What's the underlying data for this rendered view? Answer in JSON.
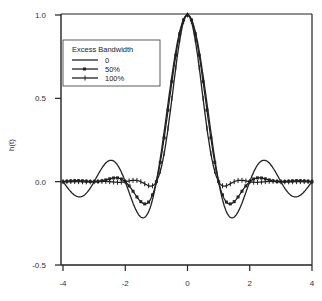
{
  "chart_data": {
    "type": "line",
    "title": "",
    "xlabel": "",
    "ylabel": "h(t)",
    "xlim": [
      -4,
      4
    ],
    "ylim": [
      -0.5,
      1.0
    ],
    "xticks": [
      "-4",
      "-2",
      "0",
      "2",
      "4"
    ],
    "yticks": [
      "1.0",
      "0.5",
      "0.0",
      "-0.5"
    ],
    "grid": false,
    "legend": {
      "title": "Excess Bandwidth",
      "position": "upper-left",
      "entries": [
        "0",
        "50%",
        "100%"
      ]
    },
    "series": [
      {
        "name": "0",
        "alpha": 0.0,
        "marker": "none",
        "x": [
          -4,
          -3.5,
          -3,
          -2.5,
          -2,
          -1.5,
          -1,
          -0.5,
          0,
          0.5,
          1,
          1.5,
          2,
          2.5,
          3,
          3.5,
          4
        ],
        "values": [
          0,
          -0.09,
          0,
          0.127,
          0,
          -0.212,
          0,
          0.637,
          1.0,
          0.637,
          0,
          -0.212,
          0,
          0.127,
          0,
          -0.09,
          0
        ]
      },
      {
        "name": "50%",
        "alpha": 0.5,
        "marker": "square",
        "x": [
          -4,
          -3.5,
          -3,
          -2.5,
          -2,
          -1.5,
          -1,
          -0.5,
          0,
          0.5,
          1,
          1.5,
          2,
          2.5,
          3,
          3.5,
          4
        ],
        "values": [
          0,
          0.0,
          0,
          0.02,
          0,
          -0.127,
          0,
          0.6,
          1.0,
          0.6,
          0,
          -0.127,
          0,
          0.02,
          0,
          0.0,
          0
        ]
      },
      {
        "name": "100%",
        "alpha": 1.0,
        "marker": "plus",
        "x": [
          -4,
          -3.5,
          -3,
          -2.5,
          -2,
          -1.5,
          -1,
          -0.5,
          0,
          0.5,
          1,
          1.5,
          2,
          2.5,
          3,
          3.5,
          4
        ],
        "values": [
          0,
          0,
          0,
          0,
          0,
          -0.024,
          0,
          0.5,
          1.0,
          0.5,
          0,
          -0.024,
          0,
          0,
          0,
          0,
          0
        ]
      }
    ]
  }
}
